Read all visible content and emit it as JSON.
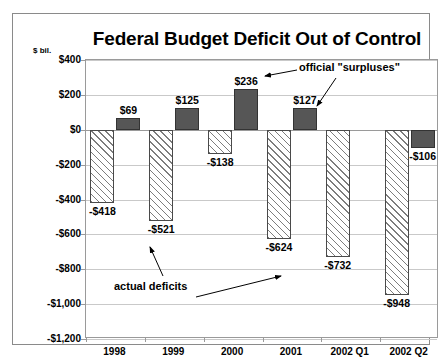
{
  "chart_data": {
    "type": "bar",
    "title": "Federal Budget Deficit Out of Control",
    "unit_label": "$ bil.",
    "xlabel": "",
    "ylabel": "",
    "ylim": [
      -1200,
      400
    ],
    "grid": true,
    "legend_position": "none",
    "categories": [
      "1998",
      "1999",
      "2000",
      "2001",
      "2002  Q1",
      "2002  Q2"
    ],
    "ytick_labels": [
      "$400",
      "$200",
      "$0",
      "-$200",
      "-$400",
      "-$600",
      "-$800",
      "-$1,000",
      "-$1,200"
    ],
    "ytick_values": [
      400,
      200,
      0,
      -200,
      -400,
      -600,
      -800,
      -1000,
      -1200
    ],
    "series": [
      {
        "name": "actual deficits",
        "style": "hatched-white",
        "values": [
          -418,
          -521,
          -138,
          -624,
          -732,
          -948
        ],
        "labels": [
          "-$418",
          "-$521",
          "-$138",
          "-$624",
          "-$732",
          "-$948"
        ]
      },
      {
        "name": "official \"surpluses\"",
        "style": "solid-dark",
        "values": [
          69,
          125,
          236,
          127,
          null,
          -106
        ],
        "labels": [
          "$69",
          "$125",
          "$236",
          "$127",
          "",
          "-$106"
        ]
      }
    ],
    "annotations": [
      {
        "text": "official \"surpluses\"",
        "id": "annot-surplus"
      },
      {
        "text": "actual deficits",
        "id": "annot-deficit"
      }
    ]
  },
  "colors": {
    "surplus_fill": "#565656",
    "deficit_fill": "#ffffff",
    "hatch": "#7d7d7d",
    "axis": "#9a9a9a",
    "grid": "#c9c9c9",
    "frame": "#8a8a8a",
    "text": "#000000"
  }
}
